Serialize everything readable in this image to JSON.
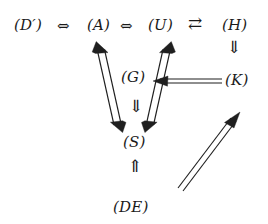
{
  "diagram": {
    "type": "implication-graph",
    "nodes": [
      {
        "id": "D",
        "label": "(D′)",
        "x": 14,
        "y": 18
      },
      {
        "id": "A",
        "label": "(A)",
        "x": 87,
        "y": 18
      },
      {
        "id": "U",
        "label": "(U)",
        "x": 148,
        "y": 18
      },
      {
        "id": "H",
        "label": "(H)",
        "x": 222,
        "y": 18
      },
      {
        "id": "G",
        "label": "(G)",
        "x": 121,
        "y": 70
      },
      {
        "id": "K",
        "label": "(K)",
        "x": 225,
        "y": 73
      },
      {
        "id": "S",
        "label": "(S)",
        "x": 123,
        "y": 135
      },
      {
        "id": "DE",
        "label": "(DE)",
        "x": 113,
        "y": 200
      }
    ],
    "operators": [
      {
        "id": "op-d-a",
        "glyph": "⇔",
        "name": "iff-d-a",
        "x": 57,
        "y": 19
      },
      {
        "id": "op-a-u",
        "glyph": "⇔",
        "name": "iff-a-u",
        "x": 120,
        "y": 19
      },
      {
        "id": "op-u-h",
        "glyph": "⇄",
        "name": "rightleft-u-h",
        "x": 188,
        "y": 15
      },
      {
        "id": "op-h-k",
        "glyph": "⇓",
        "name": "down-h-k",
        "x": 227,
        "y": 39
      },
      {
        "id": "op-g-s",
        "glyph": "⇓",
        "name": "down-g-s",
        "x": 129,
        "y": 98
      },
      {
        "id": "op-de-s",
        "glyph": "⇑",
        "name": "up-de-s",
        "x": 128,
        "y": 158
      }
    ],
    "edges": [
      {
        "id": "edge-s-a",
        "name": "double-arrow-s-a",
        "from": "S",
        "to": "A",
        "style": "double-line-both-heads"
      },
      {
        "id": "edge-s-u",
        "name": "double-arrow-s-u",
        "from": "S",
        "to": "U",
        "style": "double-line-both-heads"
      },
      {
        "id": "edge-k-g",
        "name": "arrow-k-to-g",
        "from": "K",
        "to": "G",
        "style": "double-line-left-head"
      },
      {
        "id": "edge-de-k",
        "name": "arrow-de-to-k",
        "from": "DE",
        "to": "K",
        "style": "double-line-up-head"
      }
    ],
    "colors": {
      "ink": "#1f1f1f",
      "background": "#ffffff"
    }
  }
}
